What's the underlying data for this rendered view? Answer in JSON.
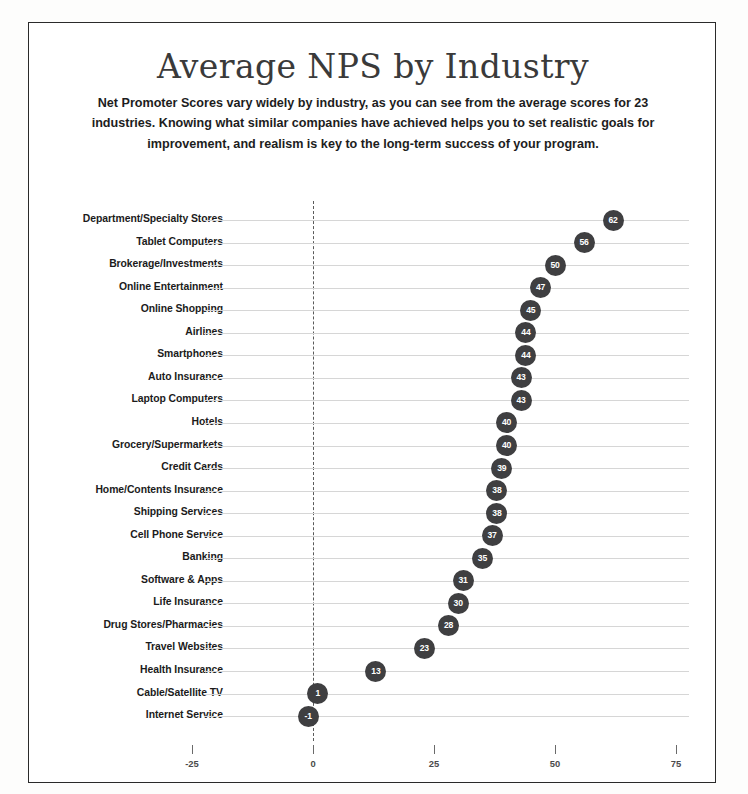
{
  "page": {
    "title": "Average NPS by Industry",
    "subtitle": "Net Promoter Scores vary widely by industry, as you can see from the average scores for 23 industries. Knowing what similar companies have achieved helps you to set realistic goals for improvement, and realism is key to the long-term success of your program."
  },
  "colors": {
    "marker": "#3f3f41",
    "marker_text": "#ffffff",
    "gridline": "#d6d6d6",
    "zero_line": "#5a5a5a",
    "border": "#2a2a2a",
    "title_text": "#3a3a3a",
    "label_text": "#1b1b1b"
  },
  "chart_data": {
    "type": "scatter",
    "title": "Average NPS by Industry",
    "subtitle": "Net Promoter Scores vary widely by industry, as you can see from the average scores for 23 industries. Knowing what similar companies have achieved helps you to set realistic goals for improvement, and realism is key to the long-term success of your program.",
    "xlabel": "",
    "ylabel": "",
    "xlim": [
      -30,
      80
    ],
    "xticks": [
      -25,
      0,
      25,
      50,
      75
    ],
    "xtick_labels": [
      "-25",
      "0",
      "25",
      "50",
      "75"
    ],
    "grid": "horizontal",
    "legend": "none",
    "zero_reference_line": 0,
    "data_labels": true,
    "orientation": "horizontal",
    "sort": "descending",
    "categories": [
      "Department/Specialty Stores",
      "Tablet Computers",
      "Brokerage/Investments",
      "Online Entertainment",
      "Online Shopping",
      "Airlines",
      "Smartphones",
      "Auto Insurance",
      "Laptop Computers",
      "Hotels",
      "Grocery/Supermarkets",
      "Credit Cards",
      "Home/Contents Insurance",
      "Shipping Services",
      "Cell Phone Service",
      "Banking",
      "Software & Apps",
      "Life Insurance",
      "Drug Stores/Pharmacies",
      "Travel Websites",
      "Health Insurance",
      "Cable/Satellite TV",
      "Internet Service"
    ],
    "values": [
      62,
      56,
      50,
      47,
      45,
      44,
      44,
      43,
      43,
      40,
      40,
      39,
      38,
      38,
      37,
      35,
      31,
      30,
      28,
      23,
      13,
      1,
      -1
    ],
    "value_labels": [
      "62",
      "56",
      "50",
      "47",
      "45",
      "44",
      "44",
      "43",
      "43",
      "40",
      "40",
      "39",
      "38",
      "38",
      "37",
      "35",
      "31",
      "30",
      "28",
      "23",
      "13",
      "1",
      "-1"
    ]
  }
}
